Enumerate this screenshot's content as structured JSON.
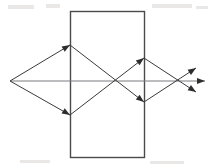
{
  "figure": {
    "title": "Optical ray diagram through a rectangular block",
    "width": 215,
    "height": 167,
    "background_color": "#ffffff",
    "stroke_color": "#3a3a3c",
    "axis_color": "#6b6b70",
    "block_color": "#4a4a4e",
    "stroke_width": 1
  },
  "chart_data": {
    "type": "diagram",
    "title": "Optical ray diagram through a rectangular block",
    "xlabel": "",
    "ylabel": "",
    "xlim": [
      0,
      215
    ],
    "ylim": [
      0,
      167
    ],
    "grid": false,
    "legend": "none",
    "coordinate_note": "SVG pixel coordinates, origin top-left",
    "points": {
      "left_focus": [
        10,
        81
      ],
      "upper_left_hit": [
        70,
        45
      ],
      "lower_left_hit": [
        70,
        115
      ],
      "inner_crossing": [
        114,
        81
      ],
      "upper_right_hit": [
        144,
        58
      ],
      "lower_right_hit": [
        144,
        102
      ],
      "right_focus": [
        181,
        81
      ],
      "axis_start": [
        10,
        81
      ],
      "axis_end": [
        205,
        81
      ],
      "arrow_tip_up": [
        196,
        68
      ],
      "arrow_tip_straight": [
        205,
        81
      ],
      "arrow_tip_down": [
        196,
        92
      ]
    },
    "block": {
      "shape": "rectangle",
      "x": 70,
      "y": 11,
      "width": 74,
      "height": 146,
      "filled": false
    },
    "rays": [
      {
        "name": "upper-incoming-ray",
        "from": [
          10,
          81
        ],
        "to": [
          70,
          45
        ],
        "arrowhead": "at-end",
        "description": "upper ray from left focus rising to the top-left face of the block"
      },
      {
        "name": "lower-incoming-ray",
        "from": [
          10,
          81
        ],
        "to": [
          70,
          115
        ],
        "arrowhead": "at-end",
        "description": "lower ray from left focus descending to the bottom-left face of the block"
      },
      {
        "name": "upper-internal-ray",
        "from": [
          70,
          45
        ],
        "to": [
          144,
          102
        ],
        "arrowhead": "at-end",
        "description": "refracted ray crossing down through the block to the lower right face"
      },
      {
        "name": "lower-internal-ray",
        "from": [
          70,
          115
        ],
        "to": [
          144,
          58
        ],
        "arrowhead": "at-end",
        "description": "refracted ray crossing up through the block to the upper right face"
      },
      {
        "name": "upper-exit-ray",
        "from": [
          144,
          58
        ],
        "to": [
          196,
          92
        ],
        "arrowhead": "at-end",
        "description": "ray exiting the upper right face, converging down through the right focus"
      },
      {
        "name": "lower-exit-ray",
        "from": [
          144,
          102
        ],
        "to": [
          196,
          68
        ],
        "arrowhead": "at-end",
        "description": "ray exiting the lower right face, converging up through the right focus"
      },
      {
        "name": "optical-axis",
        "from": [
          10,
          81
        ],
        "to": [
          205,
          81
        ],
        "arrowhead": "at-end",
        "description": "horizontal optical axis running the full width of the figure"
      }
    ],
    "arrowheads": [
      {
        "name": "arrowhead-upper-left-face",
        "at": [
          70,
          45
        ],
        "angle_deg": -31
      },
      {
        "name": "arrowhead-lower-left-face",
        "at": [
          70,
          115
        ],
        "angle_deg": 31
      },
      {
        "name": "arrowhead-upper-right-face",
        "at": [
          144,
          58
        ],
        "angle_deg": -38
      },
      {
        "name": "arrowhead-lower-right-face",
        "at": [
          144,
          102
        ],
        "angle_deg": 38
      },
      {
        "name": "arrowhead-exit-up",
        "at": [
          196,
          68
        ],
        "angle_deg": -33
      },
      {
        "name": "arrowhead-exit-straight",
        "at": [
          205,
          81
        ],
        "angle_deg": 0
      },
      {
        "name": "arrowhead-exit-down",
        "at": [
          196,
          92
        ],
        "angle_deg": 33
      }
    ]
  },
  "artifacts": [
    {
      "name": "scan-speck-top-left",
      "x": 8,
      "y": 5,
      "width": 26,
      "height": 4
    },
    {
      "name": "scan-speck-top-mid",
      "x": 46,
      "y": 4,
      "width": 14,
      "height": 4
    },
    {
      "name": "scan-speck-top-right",
      "x": 152,
      "y": 4,
      "width": 40,
      "height": 4
    },
    {
      "name": "scan-speck-upper-right",
      "x": 196,
      "y": 6,
      "width": 12,
      "height": 3
    },
    {
      "name": "scan-speck-bottom-left",
      "x": 20,
      "y": 160,
      "width": 30,
      "height": 3
    },
    {
      "name": "scan-speck-bottom-right",
      "x": 150,
      "y": 161,
      "width": 34,
      "height": 3
    }
  ]
}
